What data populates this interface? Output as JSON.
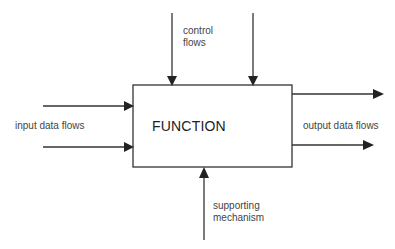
{
  "diagram": {
    "type": "IDEF0 function block",
    "function_box": {
      "label": "FUNCTION"
    },
    "labels": {
      "control": "control\nflows",
      "input": "input data flows",
      "output": "output data flows",
      "mechanism": "supporting\nmechanism"
    },
    "arrows": {
      "control": [
        {
          "direction": "down",
          "target": "top edge of FUNCTION"
        },
        {
          "direction": "down",
          "target": "top edge of FUNCTION"
        }
      ],
      "input": [
        {
          "direction": "right",
          "target": "left edge of FUNCTION"
        },
        {
          "direction": "right",
          "target": "left edge of FUNCTION"
        }
      ],
      "output": [
        {
          "direction": "right",
          "source": "right edge of FUNCTION"
        },
        {
          "direction": "right",
          "source": "right edge of FUNCTION"
        }
      ],
      "mechanism": [
        {
          "direction": "up",
          "target": "bottom edge of FUNCTION"
        }
      ]
    },
    "colors": {
      "line": "#333333",
      "text": "#444444",
      "background": "#ffffff"
    }
  }
}
